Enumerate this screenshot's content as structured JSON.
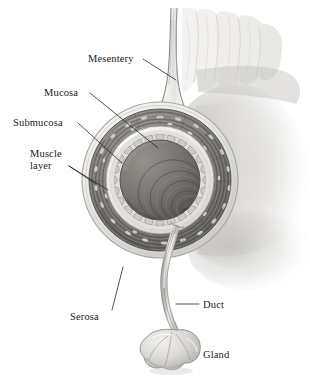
{
  "figure": {
    "background_color": "#ffffff",
    "ink_color": "#1a1a1a",
    "label_font_size_px": 10.5
  },
  "labels": [
    {
      "id": "mesentery",
      "text": "Mesentery",
      "x": 88,
      "y": 62,
      "anchor": "start",
      "lines": [
        [
          143,
          59,
          176,
          80
        ]
      ]
    },
    {
      "id": "mucosa",
      "text": "Mucosa",
      "x": 44,
      "y": 96,
      "anchor": "start",
      "lines": [
        [
          90,
          93,
          158,
          148
        ]
      ]
    },
    {
      "id": "submucosa",
      "text": "Submucosa",
      "x": 13,
      "y": 126,
      "anchor": "start",
      "lines": [
        [
          78,
          123,
          122,
          163
        ]
      ]
    },
    {
      "id": "muscle-layer-line1",
      "text": "Muscle",
      "x": 30,
      "y": 157,
      "anchor": "start",
      "lines": []
    },
    {
      "id": "muscle-layer-line2",
      "text": "layer",
      "x": 30,
      "y": 169,
      "anchor": "start",
      "lines": [
        [
          69,
          166,
          96,
          184
        ],
        [
          69,
          166,
          108,
          190
        ]
      ]
    },
    {
      "id": "serosa",
      "text": "Serosa",
      "x": 70,
      "y": 320,
      "anchor": "start",
      "lines": [
        [
          112,
          310,
          123,
          267
        ]
      ]
    },
    {
      "id": "duct",
      "text": "Duct",
      "x": 203,
      "y": 308,
      "anchor": "start",
      "lines": [
        [
          199,
          304,
          176,
          304
        ]
      ]
    },
    {
      "id": "gland",
      "text": "Gland",
      "x": 203,
      "y": 358,
      "anchor": "start",
      "lines": []
    }
  ],
  "structure": {
    "center_x": 160,
    "center_y": 180,
    "serosa_radius": 78,
    "muscle_outer_radius": 71,
    "muscle_inner_radius": 54,
    "submucosa_radius": 50,
    "mucosa_radius": 45,
    "lumen_radius": 40
  },
  "colors": {
    "serosa": "#efeeec",
    "serosa_edge": "#b9b7b4",
    "muscle_band": "#8b8984",
    "muscle_band_dark": "#6e6c68",
    "submucosa": "#e8e6e2",
    "mucosa": "#d6d4d0",
    "lumen": "#7a7874",
    "lumen_deep": "#5e5c59",
    "mesentery": "#e9e8e5",
    "duct": "#cfcdc9",
    "gland": "#d8d6d2",
    "shadow": "#c9c7c3"
  },
  "parts": [
    {
      "id": "mesentery",
      "name": "mesentery",
      "description": "double-walled fatty sheet rising from the top of the tube"
    },
    {
      "id": "serosa",
      "name": "serosa",
      "description": "smooth pale outermost coat"
    },
    {
      "id": "muscle-layer",
      "name": "muscle layer",
      "description": "dark fibrous circular and longitudinal muscle bands"
    },
    {
      "id": "submucosa",
      "name": "submucosa",
      "description": "pale ring beneath the muscle"
    },
    {
      "id": "mucosa",
      "name": "mucosa",
      "description": "scalloped innermost lining around the lumen"
    },
    {
      "id": "lumen",
      "name": "lumen",
      "description": "dark central cavity with receding folds"
    },
    {
      "id": "duct",
      "name": "duct",
      "description": "slender tube from the wall down to the gland"
    },
    {
      "id": "gland",
      "name": "gland",
      "description": "trilobed accessory gland"
    }
  ]
}
